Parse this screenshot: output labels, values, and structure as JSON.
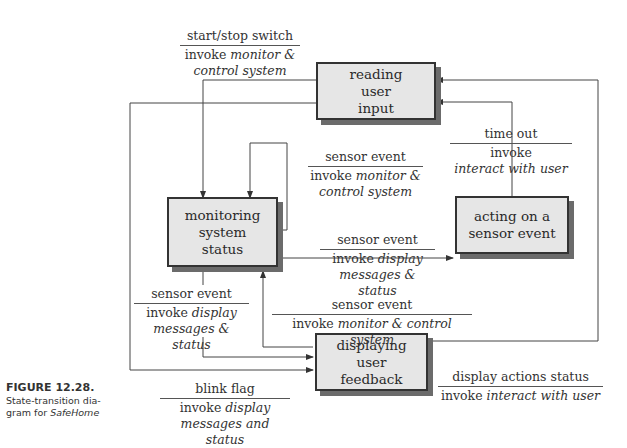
{
  "states": {
    "reading": {
      "line1": "reading",
      "line2": "user",
      "line3": "input"
    },
    "monitoring": {
      "line1": "monitoring",
      "line2": "system",
      "line3": "status"
    },
    "acting": {
      "line1": "acting on a",
      "line2": "sensor event"
    },
    "displaying": {
      "line1": "displaying",
      "line2": "user",
      "line3": "feedback"
    }
  },
  "transitions": {
    "start_stop": {
      "event": "start/stop switch",
      "action_prefix": "invoke ",
      "action_italic1": "monitor &",
      "action_italic2": "control system"
    },
    "self_loop": {
      "event": "sensor event",
      "action_prefix": "invoke ",
      "action_italic1": "monitor &",
      "action_italic2": "control system"
    },
    "time_out": {
      "event": "time out",
      "action_prefix": "invoke",
      "action_italic": "interact with user"
    },
    "monitor_to_acting": {
      "event": "sensor event",
      "action_prefix": "invoke ",
      "action_italic1": "display",
      "action_italic2": "messages & status"
    },
    "monitor_to_display": {
      "event": "sensor event",
      "action_prefix": "invoke ",
      "action_italic1": "display",
      "action_italic2": "messages & status"
    },
    "display_to_monitor": {
      "event": "sensor event",
      "action_prefix": "invoke ",
      "action_italic": "monitor & control system"
    },
    "blink": {
      "event": "blink flag",
      "action_prefix": "invoke ",
      "action_italic1": "display",
      "action_italic2": "messages and status"
    },
    "display_actions": {
      "event": "display actions status",
      "action_prefix": "invoke ",
      "action_italic": "interact with user"
    }
  },
  "caption": {
    "figure": "FIGURE 12.28.",
    "line1": "State-transition dia-",
    "line2": "gram for ",
    "line2_italic": "SafeHome"
  }
}
